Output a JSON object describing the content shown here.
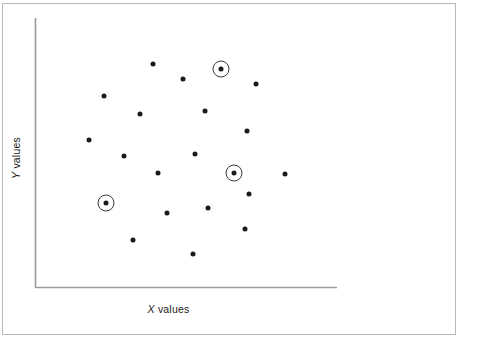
{
  "figure": {
    "width": 481,
    "height": 344,
    "background_color": "#ffffff",
    "border_color": "#b9b9b9",
    "axis_color": "#9a9a9a",
    "point_color": "#1a1a1a",
    "highlight_ring_color": "#3a3a3a"
  },
  "axes": {
    "x_label_var": "X",
    "x_label_text": " values",
    "y_label_var": "Y",
    "y_label_text": " values",
    "x_axis_full": "X values",
    "y_axis_full": "Y values"
  },
  "chart_data": {
    "type": "scatter",
    "title": "",
    "xlabel": "X values",
    "ylabel": "Y values",
    "xlim": [
      0,
      100
    ],
    "ylim": [
      0,
      100
    ],
    "grid": false,
    "legend": null,
    "tick_labels": {
      "x": [],
      "y": []
    },
    "axis_spines": {
      "left": true,
      "bottom": true,
      "top": false,
      "right": false
    },
    "marker_size_px": 5,
    "highlight_ring_radius_px": 8,
    "series": [
      {
        "name": "Data points",
        "points": [
          {
            "px": 153,
            "py": 64,
            "x": 39.1,
            "y": 82.9,
            "highlighted": false
          },
          {
            "px": 221,
            "py": 69,
            "x": 61.6,
            "y": 81.1,
            "highlighted": true
          },
          {
            "px": 183,
            "py": 79,
            "x": 49.0,
            "y": 77.3,
            "highlighted": false
          },
          {
            "px": 256,
            "py": 84,
            "x": 73.2,
            "y": 75.5,
            "highlighted": false
          },
          {
            "px": 104,
            "py": 96,
            "x": 22.8,
            "y": 71.0,
            "highlighted": false
          },
          {
            "px": 140,
            "py": 114,
            "x": 34.8,
            "y": 64.3,
            "highlighted": false
          },
          {
            "px": 205,
            "py": 111,
            "x": 56.3,
            "y": 65.4,
            "highlighted": false
          },
          {
            "px": 247,
            "py": 131,
            "x": 70.2,
            "y": 58.0,
            "highlighted": false
          },
          {
            "px": 89,
            "py": 140,
            "x": 17.9,
            "y": 54.6,
            "highlighted": false
          },
          {
            "px": 124,
            "py": 156,
            "x": 29.5,
            "y": 48.7,
            "highlighted": false
          },
          {
            "px": 195,
            "py": 154,
            "x": 52.9,
            "y": 49.4,
            "highlighted": false
          },
          {
            "px": 158,
            "py": 173,
            "x": 40.7,
            "y": 42.4,
            "highlighted": false
          },
          {
            "px": 234,
            "py": 173,
            "x": 65.9,
            "y": 42.4,
            "highlighted": true
          },
          {
            "px": 285,
            "py": 174,
            "x": 82.8,
            "y": 42.0,
            "highlighted": false
          },
          {
            "px": 106,
            "py": 203,
            "x": 23.5,
            "y": 31.2,
            "highlighted": false
          },
          {
            "px": 249,
            "py": 194,
            "x": 70.9,
            "y": 34.6,
            "highlighted": false
          },
          {
            "px": 208,
            "py": 208,
            "x": 57.3,
            "y": 29.4,
            "highlighted": false
          },
          {
            "px": 167,
            "py": 213,
            "x": 43.7,
            "y": 27.5,
            "highlighted": false
          },
          {
            "px": 245,
            "py": 229,
            "x": 69.5,
            "y": 21.6,
            "highlighted": false
          },
          {
            "px": 133,
            "py": 240,
            "x": 32.5,
            "y": 17.5,
            "highlighted": false
          },
          {
            "px": 193,
            "py": 254,
            "x": 52.3,
            "y": 12.3,
            "highlighted": false
          }
        ]
      }
    ],
    "annotations": [
      {
        "type": "ring",
        "px": 221,
        "py": 69,
        "description": "circled outlier point upper area"
      },
      {
        "type": "ring",
        "px": 234,
        "py": 173,
        "description": "circled point center right"
      },
      {
        "type": "ring",
        "px": 106,
        "py": 203,
        "description": "circled point lower left"
      }
    ]
  }
}
